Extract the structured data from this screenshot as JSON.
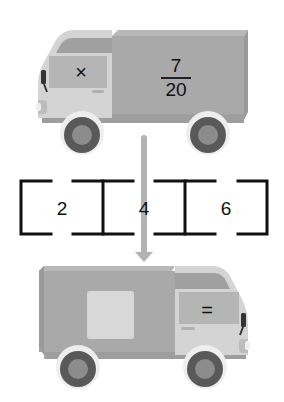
{
  "top_truck": {
    "direction": "left",
    "cab_symbol": "×",
    "cargo_fraction": {
      "numerator": "7",
      "denominator": "20"
    }
  },
  "arrow": {
    "direction": "down",
    "color": "#b3b3b3"
  },
  "number_line": {
    "values": [
      "2",
      "4",
      "6"
    ]
  },
  "bottom_truck": {
    "direction": "right",
    "cab_symbol": "=",
    "cargo_blank": ""
  },
  "colors": {
    "cargo": "#a9a9a9",
    "cargo_side": "#9a9a9a",
    "cargo_top": "#b8b8b8",
    "cab_body": "#d4d4d4",
    "cab_roof": "#a0a0a0",
    "window": "#b5b5b5",
    "wheel_outer": "#595959",
    "wheel_inner": "#8c8c8c",
    "wheel_arch": "#eeeeee",
    "chassis": "#9e9e9e",
    "blank_box": "#d8d8d8",
    "bracket": "#111111"
  }
}
